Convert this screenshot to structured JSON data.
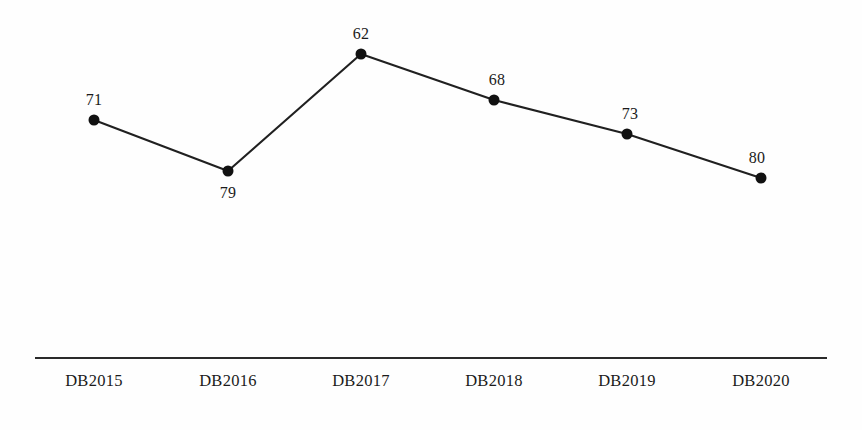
{
  "chart_data": {
    "type": "line",
    "title": "",
    "subtitle": "",
    "xlabel": "",
    "ylabel": "",
    "categories": [
      "DB2015",
      "DB2016",
      "DB2017",
      "DB2018",
      "DB2019",
      "DB2020"
    ],
    "values": [
      71,
      79,
      62,
      68,
      73,
      80
    ],
    "series": [
      {
        "name": "",
        "values": [
          71,
          79,
          62,
          68,
          73,
          80
        ]
      }
    ],
    "point_labels": [
      "71",
      "79",
      "62",
      "68",
      "73",
      "80"
    ],
    "grid": false,
    "legend": false,
    "legend_position": "none",
    "ylim": [
      null,
      null
    ],
    "axis": {
      "x_axis_visible": true,
      "y_axis_visible": false,
      "x_tick_marks": false
    },
    "style": {
      "line_color": "#202020",
      "marker_color": "#111111",
      "marker_shape": "circle",
      "axis_color": "#2a2a2a",
      "label_color": "#1b1b1b",
      "background_color": "#fefefe"
    },
    "note": "Labels are plotted at inverted vertical positions relative to their numeric values; rendered point pixel positions are preserved below."
  },
  "geometry": {
    "axis": {
      "x1": 35,
      "x2": 827,
      "y": 357,
      "thickness": 2
    },
    "points": [
      {
        "category": "DB2015",
        "label": "71",
        "px": 94,
        "py": 120,
        "label_px": 94,
        "label_py": 100
      },
      {
        "category": "DB2016",
        "label": "79",
        "px": 228,
        "py": 171,
        "label_px": 228,
        "label_py": 193
      },
      {
        "category": "DB2017",
        "label": "62",
        "px": 361,
        "py": 54,
        "label_px": 361,
        "label_py": 34
      },
      {
        "category": "DB2018",
        "label": "68",
        "px": 494,
        "py": 100,
        "label_px": 497,
        "label_py": 80
      },
      {
        "category": "DB2019",
        "label": "73",
        "px": 627,
        "py": 134,
        "label_px": 630,
        "label_py": 114
      },
      {
        "category": "DB2020",
        "label": "80",
        "px": 761,
        "py": 178,
        "label_px": 757,
        "label_py": 158
      }
    ],
    "tick_labels": [
      {
        "text": "DB2015",
        "px": 94,
        "py": 373
      },
      {
        "text": "DB2016",
        "px": 228,
        "py": 373
      },
      {
        "text": "DB2017",
        "px": 361,
        "py": 373
      },
      {
        "text": "DB2018",
        "px": 494,
        "py": 373
      },
      {
        "text": "DB2019",
        "px": 627,
        "py": 373
      },
      {
        "text": "DB2020",
        "px": 761,
        "py": 373
      }
    ],
    "marker_radius": 5.5
  }
}
